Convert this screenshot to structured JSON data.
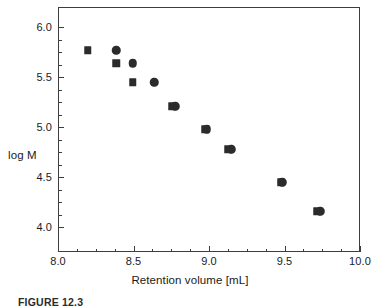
{
  "figure": {
    "caption": "FIGURE 12.3"
  },
  "axes": {
    "xlabel": "Retention volume [mL]",
    "ylabel": "log M",
    "x_tick_labels": [
      "8.0",
      "8.5",
      "9.0",
      "9.5",
      "10.0"
    ],
    "y_tick_labels": [
      "6.0",
      "5.5",
      "5.0",
      "4.5",
      "4.0"
    ]
  },
  "colors": {
    "marker": "#2b2b2b",
    "frame": "#3d3d3d",
    "text": "#1a1a1a",
    "background": "#ffffff"
  },
  "chart_data": {
    "type": "scatter",
    "title": "",
    "xlabel": "Retention volume [mL]",
    "ylabel": "log M",
    "xlim": [
      8.0,
      10.0
    ],
    "ylim": [
      3.75,
      6.2
    ],
    "grid": false,
    "legend": "none",
    "x_ticks": [
      8.0,
      8.5,
      9.0,
      9.5,
      10.0
    ],
    "y_ticks": [
      6.0,
      5.5,
      5.0,
      4.5,
      4.0
    ],
    "x_minor_tick_step": 0.125,
    "y_minor_tick_step": 0.125,
    "series": [
      {
        "name": "square-series",
        "marker": "square",
        "points": [
          {
            "x": 8.19,
            "y": 5.78
          },
          {
            "x": 8.38,
            "y": 5.65
          },
          {
            "x": 8.49,
            "y": 5.46
          },
          {
            "x": 8.75,
            "y": 5.22
          },
          {
            "x": 8.97,
            "y": 4.99
          },
          {
            "x": 9.12,
            "y": 4.79
          },
          {
            "x": 9.47,
            "y": 4.46
          },
          {
            "x": 9.71,
            "y": 4.17
          }
        ]
      },
      {
        "name": "circle-series",
        "marker": "circle",
        "points": [
          {
            "x": 8.38,
            "y": 5.78
          },
          {
            "x": 8.49,
            "y": 5.65
          },
          {
            "x": 8.63,
            "y": 5.46
          },
          {
            "x": 8.77,
            "y": 5.22
          },
          {
            "x": 8.98,
            "y": 4.99
          },
          {
            "x": 9.14,
            "y": 4.79
          },
          {
            "x": 9.48,
            "y": 4.46
          },
          {
            "x": 9.73,
            "y": 4.17
          }
        ]
      }
    ]
  }
}
